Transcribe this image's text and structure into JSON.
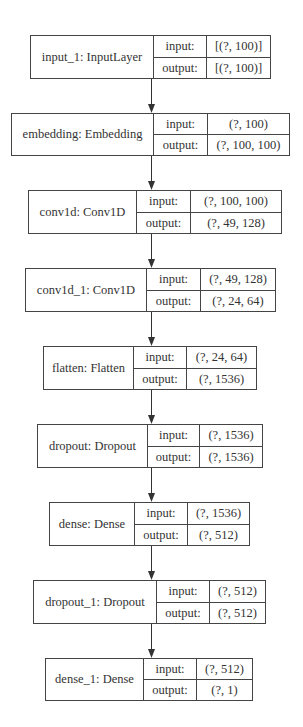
{
  "diagram": {
    "type": "keras-model-plot",
    "io_labels": {
      "input": "input:",
      "output": "output:"
    },
    "colors": {
      "border": "#444444",
      "text": "#333333",
      "edge": "#333333",
      "background": "#ffffff"
    },
    "nodes": [
      {
        "id": "input_1",
        "name": "input_1: InputLayer",
        "input": "[(?, 100)]",
        "output": "[(?, 100)]",
        "box": {
          "x": 30,
          "y": 35,
          "w": 241,
          "h": 44,
          "name_w": 123,
          "label_w": 53
        }
      },
      {
        "id": "embedding",
        "name": "embedding: Embedding",
        "input": "(?, 100)",
        "output": "(?, 100, 100)",
        "box": {
          "x": 11,
          "y": 113,
          "w": 279,
          "h": 43,
          "name_w": 142,
          "label_w": 54
        }
      },
      {
        "id": "conv1d",
        "name": "conv1d: Conv1D",
        "input": "(?, 100, 100)",
        "output": "(?, 49, 128)",
        "box": {
          "x": 28,
          "y": 190,
          "w": 254,
          "h": 44,
          "name_w": 108,
          "label_w": 54
        }
      },
      {
        "id": "conv1d_1",
        "name": "conv1d_1: Conv1D",
        "input": "(?, 49, 128)",
        "output": "(?, 24, 64)",
        "box": {
          "x": 25,
          "y": 268,
          "w": 251,
          "h": 44,
          "name_w": 121,
          "label_w": 54
        }
      },
      {
        "id": "flatten",
        "name": "flatten: Flatten",
        "input": "(?, 24, 64)",
        "output": "(?, 1536)",
        "box": {
          "x": 43,
          "y": 346,
          "w": 214,
          "h": 44,
          "name_w": 90,
          "label_w": 53
        }
      },
      {
        "id": "dropout",
        "name": "dropout: Dropout",
        "input": "(?, 1536)",
        "output": "(?, 1536)",
        "box": {
          "x": 37,
          "y": 424,
          "w": 226,
          "h": 44,
          "name_w": 110,
          "label_w": 52
        }
      },
      {
        "id": "dense",
        "name": "dense: Dense",
        "input": "(?, 1536)",
        "output": "(?, 512)",
        "box": {
          "x": 49,
          "y": 502,
          "w": 201,
          "h": 44,
          "name_w": 85,
          "label_w": 53
        }
      },
      {
        "id": "dropout_1",
        "name": "dropout_1: Dropout",
        "input": "(?, 512)",
        "output": "(?, 512)",
        "box": {
          "x": 33,
          "y": 580,
          "w": 233,
          "h": 44,
          "name_w": 123,
          "label_w": 53
        }
      },
      {
        "id": "dense_1",
        "name": "dense_1: Dense",
        "input": "(?, 512)",
        "output": "(?, 1)",
        "box": {
          "x": 45,
          "y": 658,
          "w": 208,
          "h": 43,
          "name_w": 98,
          "label_w": 53
        }
      }
    ],
    "edges": [
      {
        "from": "input_1",
        "to": "embedding"
      },
      {
        "from": "embedding",
        "to": "conv1d"
      },
      {
        "from": "conv1d",
        "to": "conv1d_1"
      },
      {
        "from": "conv1d_1",
        "to": "flatten"
      },
      {
        "from": "flatten",
        "to": "dropout"
      },
      {
        "from": "dropout",
        "to": "dense"
      },
      {
        "from": "dense",
        "to": "dropout_1"
      },
      {
        "from": "dropout_1",
        "to": "dense_1"
      }
    ],
    "edge_x": 151
  }
}
